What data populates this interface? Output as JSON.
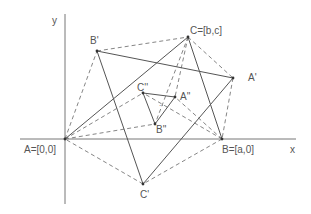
{
  "diagram": {
    "axes": {
      "x_label": "x",
      "y_label": "y",
      "origin": [
        65,
        139
      ],
      "x_axis": {
        "from": [
          20,
          139
        ],
        "to": [
          296,
          139
        ]
      },
      "y_axis": {
        "from": [
          65,
          14
        ],
        "to": [
          65,
          204
        ]
      }
    },
    "points": {
      "A": {
        "label": "A=[0,0]",
        "xy": [
          65,
          139
        ],
        "label_xy": [
          24,
          153
        ]
      },
      "B": {
        "label": "B=[a,0]",
        "xy": [
          222,
          139
        ],
        "label_xy": [
          222,
          153
        ]
      },
      "C": {
        "label": "C=[b,c]",
        "xy": [
          188,
          37
        ],
        "label_xy": [
          190,
          34
        ]
      },
      "A1": {
        "label": "A'",
        "xy": [
          233,
          78
        ],
        "label_xy": [
          248,
          81
        ]
      },
      "B1": {
        "label": "B'",
        "xy": [
          97,
          51
        ],
        "label_xy": [
          90,
          44
        ]
      },
      "C1": {
        "label": "C'",
        "xy": [
          143,
          184
        ],
        "label_xy": [
          140,
          198
        ]
      },
      "A2": {
        "label": "A''",
        "xy": [
          175,
          97
        ],
        "label_xy": [
          180,
          100
        ]
      },
      "B2": {
        "label": "B''",
        "xy": [
          155,
          124
        ],
        "label_xy": [
          156,
          133
        ]
      },
      "C2": {
        "label": "C''",
        "xy": [
          143,
          93
        ],
        "label_xy": [
          137,
          91
        ]
      }
    },
    "tick_mark": "··",
    "solid_segments": [
      [
        "A",
        "C"
      ],
      [
        "C",
        "B"
      ],
      [
        "B1",
        "A1"
      ],
      [
        "B1",
        "C1"
      ],
      [
        "C1",
        "A1"
      ],
      [
        "C2",
        "A2"
      ],
      [
        "A2",
        "B2"
      ],
      [
        "B2",
        "C2"
      ]
    ],
    "dashed_segments": [
      [
        "A",
        "B1"
      ],
      [
        "B1",
        "C"
      ],
      [
        "C",
        "A1"
      ],
      [
        "A1",
        "B"
      ],
      [
        "B",
        "C1"
      ],
      [
        "C1",
        "A"
      ],
      [
        "A",
        "C2"
      ],
      [
        "A",
        "B2"
      ],
      [
        "B",
        "C2"
      ],
      [
        "B",
        "A2"
      ],
      [
        "C",
        "B2"
      ],
      [
        "C",
        "A2"
      ]
    ],
    "colors": {
      "line": "#555555",
      "dashed": "#777777",
      "text": "#555555",
      "background": "#ffffff"
    }
  }
}
